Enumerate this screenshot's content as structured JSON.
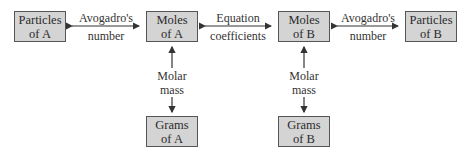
{
  "diagram": {
    "boxes": {
      "particles_a": {
        "line1": "Particles",
        "line2": "of A"
      },
      "moles_a": {
        "line1": "Moles",
        "line2": "of A"
      },
      "moles_b": {
        "line1": "Moles",
        "line2": "of B"
      },
      "particles_b": {
        "line1": "Particles",
        "line2": "of B"
      },
      "grams_a": {
        "line1": "Grams",
        "line2": "of A"
      },
      "grams_b": {
        "line1": "Grams",
        "line2": "of B"
      }
    },
    "labels": {
      "avogadro_left": {
        "line1": "Avogadro's",
        "line2": "number"
      },
      "equation": {
        "line1": "Equation",
        "line2": "coefficients"
      },
      "avogadro_right": {
        "line1": "Avogadro's",
        "line2": "number"
      },
      "molar_a": {
        "line1": "Molar",
        "line2": "mass"
      },
      "molar_b": {
        "line1": "Molar",
        "line2": "mass"
      }
    },
    "colors": {
      "box_fill": "#d4d4d4",
      "box_border": "#555555",
      "arrow": "#333333"
    }
  }
}
